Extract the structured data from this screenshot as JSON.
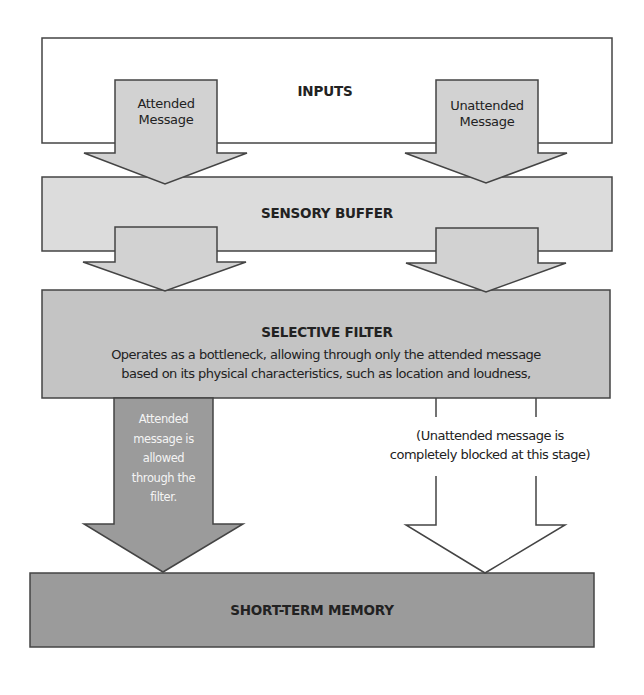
{
  "diagram": {
    "colors": {
      "inputs_fill": "#ffffff",
      "sensory_fill": "#dcdcdc",
      "filter_fill": "#c4c4c4",
      "memory_fill": "#9b9b9b",
      "light_arrow_fill": "#d2d2d2",
      "dark_arrow_fill": "#9b9b9b",
      "blocked_arrow_fill": "#ffffff",
      "stroke": "#444444"
    },
    "stages": {
      "inputs": {
        "label": "INPUTS"
      },
      "sensory_buffer": {
        "label": "SENSORY BUFFER"
      },
      "selective_filter": {
        "label": "SELECTIVE FILTER",
        "description_line1": "Operates as a bottleneck, allowing through only the attended message",
        "description_line2": "based on its physical characteristics, such as location and loudness,"
      },
      "short_term_memory": {
        "label": "SHORT-TERM MEMORY"
      }
    },
    "arrows": {
      "attended_input": {
        "line1": "Attended",
        "line2": "Message"
      },
      "unattended_input": {
        "line1": "Unattended",
        "line2": "Message"
      },
      "attended_passed": {
        "line1": "Attended",
        "line2": "message is",
        "line3": "allowed",
        "line4": "through the",
        "line5": "filter."
      },
      "unattended_blocked": {
        "line1": "(Unattended message is",
        "line2": "completely blocked at this stage)"
      }
    }
  }
}
